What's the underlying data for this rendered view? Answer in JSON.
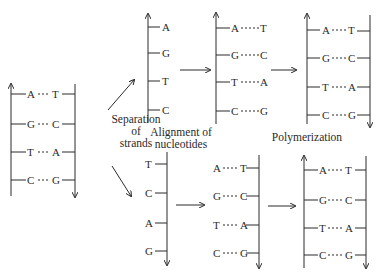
{
  "labels": {
    "separation": [
      "Separation",
      "of",
      "strands"
    ],
    "alignment": [
      "Alignment of",
      "nucleotides"
    ],
    "polymerization": "Polymerization"
  },
  "parent_duplex": {
    "pairs": [
      [
        "A",
        "T"
      ],
      [
        "G",
        "C"
      ],
      [
        "T",
        "A"
      ],
      [
        "C",
        "G"
      ]
    ]
  },
  "top_branch": {
    "separated_strand": [
      "A",
      "G",
      "T",
      "C"
    ],
    "aligned_pairs": [
      [
        "A",
        "T"
      ],
      [
        "G",
        "C"
      ],
      [
        "T",
        "A"
      ],
      [
        "C",
        "G"
      ]
    ],
    "polymerized_pairs": [
      [
        "A",
        "T"
      ],
      [
        "G",
        "C"
      ],
      [
        "T",
        "A"
      ],
      [
        "C",
        "G"
      ]
    ]
  },
  "bottom_branch": {
    "separated_strand": [
      "T",
      "C",
      "A",
      "G"
    ],
    "aligned_pairs": [
      [
        "A",
        "T"
      ],
      [
        "G",
        "C"
      ],
      [
        "T",
        "A"
      ],
      [
        "C",
        "G"
      ]
    ],
    "polymerized_pairs": [
      [
        "A",
        "T"
      ],
      [
        "G",
        "C"
      ],
      [
        "T",
        "A"
      ],
      [
        "C",
        "G"
      ]
    ]
  },
  "colors": {
    "ink": "#2a2a2a",
    "background": "#ffffff"
  }
}
